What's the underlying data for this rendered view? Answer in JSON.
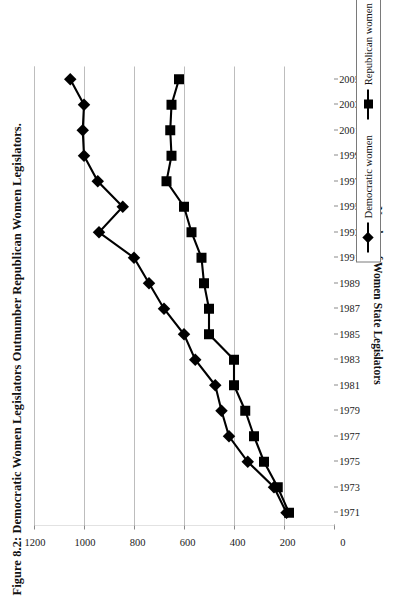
{
  "figure": {
    "title": "Figure 8.2:  Democratic Women Legislators Outnumber Republican Women Legislators."
  },
  "legend": {
    "position": "bottom-right",
    "entries": [
      {
        "label": "Democratic women",
        "marker": "diamond-marker-icon",
        "color": "#000000"
      },
      {
        "label": "Republican women",
        "marker": "square-marker-icon",
        "color": "#000000"
      }
    ]
  },
  "axes": {
    "value_axis_title": "Number of Women State Legislators",
    "value_ticks": [
      "0",
      "200",
      "400",
      "600",
      "800",
      "1000",
      "1200"
    ],
    "year_ticks": [
      "1971",
      "1973",
      "1975",
      "1977",
      "1979",
      "1981",
      "1983",
      "1985",
      "1987",
      "1989",
      "1991",
      "1993",
      "1995",
      "1997",
      "1999",
      "2001",
      "2003",
      "2005"
    ]
  },
  "chart_data": {
    "type": "line",
    "title": "Figure 8.2:  Democratic Women Legislators Outnumber Republican Women Legislators.",
    "xlabel": "",
    "ylabel": "Number of Women State Legislators",
    "ylim": [
      0,
      1200
    ],
    "grid": true,
    "legend_position": "bottom-right",
    "orientation": "rotated-90-ccw",
    "x": [
      1971,
      1973,
      1975,
      1977,
      1979,
      1981,
      1983,
      1985,
      1987,
      1989,
      1991,
      1993,
      1995,
      1997,
      1999,
      2001,
      2003,
      2005
    ],
    "series": [
      {
        "name": "Democratic women",
        "marker": "diamond",
        "values": [
          190,
          240,
          345,
          420,
          450,
          475,
          555,
          600,
          680,
          740,
          800,
          940,
          845,
          945,
          1000,
          1005,
          1000,
          1055
        ]
      },
      {
        "name": "Republican women",
        "marker": "square",
        "values": [
          180,
          225,
          280,
          320,
          355,
          400,
          400,
          500,
          500,
          520,
          530,
          570,
          600,
          670,
          650,
          655,
          650,
          620
        ]
      }
    ]
  }
}
